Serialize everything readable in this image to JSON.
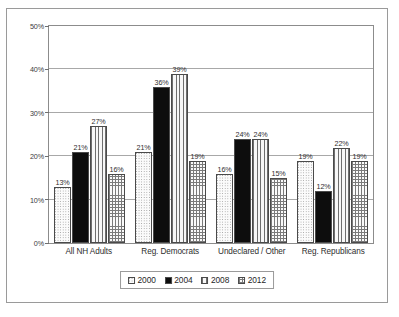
{
  "chart_data": {
    "type": "bar",
    "title": "",
    "subtitle": "",
    "xlabel": "",
    "ylabel": "",
    "ylim": [
      0,
      50
    ],
    "ytick_labels": [
      "0%",
      "10%",
      "20%",
      "30%",
      "40%",
      "50%"
    ],
    "ytick_values": [
      0,
      10,
      20,
      30,
      40,
      50
    ],
    "grid": true,
    "legend_position": "bottom",
    "value_label_suffix": "%",
    "categories": [
      "All NH Adults",
      "Reg. Democrats",
      "Undeclared / Other",
      "Reg. Republicans"
    ],
    "series": [
      {
        "name": "2000",
        "pattern": "light-dotted",
        "values": [
          13,
          21,
          16,
          19
        ],
        "labels": [
          "13%",
          "21%",
          "16%",
          "19%"
        ]
      },
      {
        "name": "2004",
        "pattern": "solid-black",
        "values": [
          21,
          36,
          24,
          12
        ],
        "labels": [
          "21%",
          "36%",
          "24%",
          "12%"
        ]
      },
      {
        "name": "2008",
        "pattern": "vertical-stripes",
        "values": [
          27,
          39,
          24,
          22
        ],
        "labels": [
          "27%",
          "39%",
          "24%",
          "22%"
        ]
      },
      {
        "name": "2012",
        "pattern": "crosshatch-grid",
        "values": [
          16,
          19,
          15,
          19
        ],
        "labels": [
          "16%",
          "19%",
          "15%",
          "19%"
        ]
      }
    ]
  },
  "legend": {
    "entries": [
      {
        "label": "2000"
      },
      {
        "label": "2004"
      },
      {
        "label": "2008"
      },
      {
        "label": "2012"
      }
    ]
  },
  "colors": {
    "frame_border": "#9a9a9a",
    "plot_border": "#8c8c8c",
    "gridline": "#a8a8a8",
    "bar_outline": "#4a4a4a",
    "series_2004_fill": "#0d0d0d",
    "text": "#2e2e2e",
    "background": "#ffffff"
  }
}
